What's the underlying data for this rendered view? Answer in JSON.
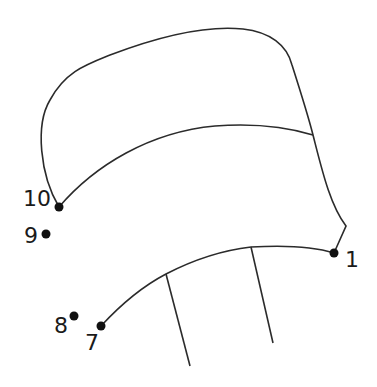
{
  "puzzle": {
    "type": "connect-the-dots",
    "line_color": "#2b2b2b",
    "dot_color": "#111111",
    "dots": [
      {
        "label": "1",
        "x": 334,
        "y": 253,
        "label_x": 345,
        "label_y": 249
      },
      {
        "label": "7",
        "x": 101,
        "y": 326,
        "label_x": 85,
        "label_y": 332
      },
      {
        "label": "8",
        "x": 74,
        "y": 316,
        "label_x": 54,
        "label_y": 315
      },
      {
        "label": "9",
        "x": 46,
        "y": 234,
        "label_x": 24,
        "label_y": 225
      },
      {
        "label": "10",
        "x": 59,
        "y": 207,
        "label_x": 23,
        "label_y": 188
      }
    ]
  }
}
